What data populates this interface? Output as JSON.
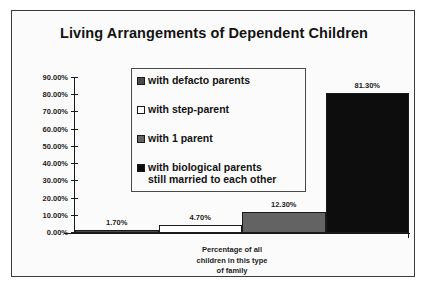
{
  "chart_data": {
    "type": "bar",
    "title": "Living Arrangements of Dependent Children",
    "xlabel": "Percentage of all\nchildren in this type\nof family",
    "ylabel": "",
    "categories": [
      "with defacto parents",
      "with step-parent",
      "with 1 parent",
      "with biological parents still married to each other"
    ],
    "values": [
      1.7,
      4.7,
      12.3,
      81.3
    ],
    "value_labels": [
      "1.70%",
      "4.70%",
      "12.30%",
      "81.30%"
    ],
    "ylim": [
      0,
      90
    ],
    "ytick_values": [
      90,
      80,
      70,
      60,
      50,
      40,
      30,
      20,
      10,
      0
    ],
    "ytick_labels": [
      "90.00%",
      "80.00%",
      "70.00%",
      "60.00%",
      "50.00%",
      "40.00%",
      "30.00%",
      "20.00%",
      "10.00%",
      "0.00%"
    ],
    "grid": false,
    "legend_position": "inside-upper-center",
    "series_colors": [
      "#4a4a4a",
      "#ffffff",
      "#636363",
      "#0d0d0d"
    ],
    "legend": [
      {
        "label": "with defacto parents",
        "color": "#4a4a4a"
      },
      {
        "label": "with step-parent",
        "color": "#ffffff"
      },
      {
        "label": "with 1 parent",
        "color": "#636363"
      },
      {
        "label": "with biological parents\nstill married to each other",
        "color": "#0d0d0d"
      }
    ]
  },
  "frame": {
    "border_color": "#3c3c3c",
    "background": "#fbfbfb"
  }
}
